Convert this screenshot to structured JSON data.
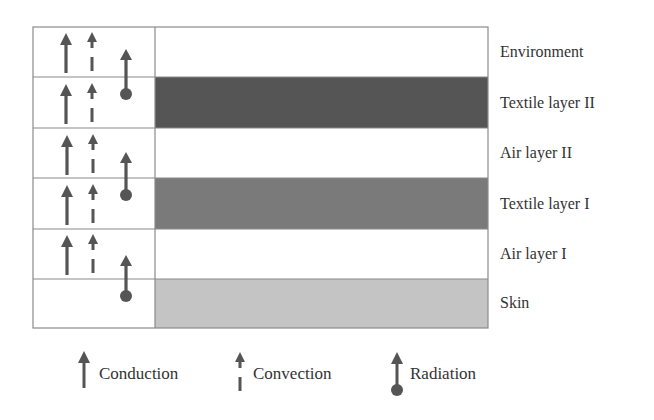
{
  "diagram": {
    "title": "",
    "colors": {
      "border": "#888888",
      "arrow": "#555555",
      "textile_layer_ii": "#555555",
      "textile_layer_i": "#7a7a7a",
      "skin": "#c4c4c4",
      "air": "#ffffff"
    },
    "layers": [
      {
        "label": "Environment",
        "fill": "#ffffff",
        "conduction": true,
        "convection": true,
        "radiation": "arrow-up-from-below"
      },
      {
        "label": "Textile layer II",
        "fill": "#555555",
        "conduction": true,
        "convection": true,
        "radiation": "source"
      },
      {
        "label": "Air layer II",
        "fill": "#ffffff",
        "conduction": true,
        "convection": true,
        "radiation": "arrow-up-from-below"
      },
      {
        "label": "Textile layer I",
        "fill": "#7a7a7a",
        "conduction": true,
        "convection": true,
        "radiation": "source"
      },
      {
        "label": "Air layer I",
        "fill": "#ffffff",
        "conduction": true,
        "convection": true,
        "radiation": "arrow-up-from-below"
      },
      {
        "label": "Skin",
        "fill": "#c4c4c4",
        "conduction": false,
        "convection": false,
        "radiation": "source"
      }
    ]
  },
  "legend": {
    "items": [
      {
        "label": "Conduction",
        "icon": "solid-arrow-up-icon"
      },
      {
        "label": "Convection",
        "icon": "dashed-arrow-up-icon"
      },
      {
        "label": "Radiation",
        "icon": "ball-arrow-up-icon"
      }
    ]
  }
}
